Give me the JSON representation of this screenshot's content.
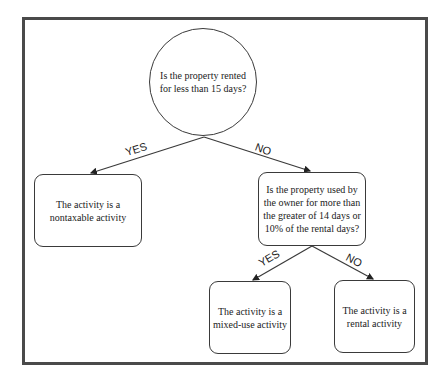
{
  "diagram": {
    "type": "decision-tree",
    "root": {
      "question": "Is the property rented for less than 15 days?"
    },
    "branches": {
      "root_yes_label": "YES",
      "root_no_label": "NO",
      "second_yes_label": "YES",
      "second_no_label": "NO"
    },
    "nodes": {
      "nontaxable": "The activity is a nontaxable activity",
      "second_question": "Is the property used by the owner for more than the greater of 14 days or 10% of the rental days?",
      "mixed_use": "The activity is a mixed-use activity",
      "rental": "The activity is a rental activity"
    },
    "colors": {
      "line": "#3a3a3a",
      "frame": "#4a4a4a",
      "background": "#ffffff"
    }
  }
}
